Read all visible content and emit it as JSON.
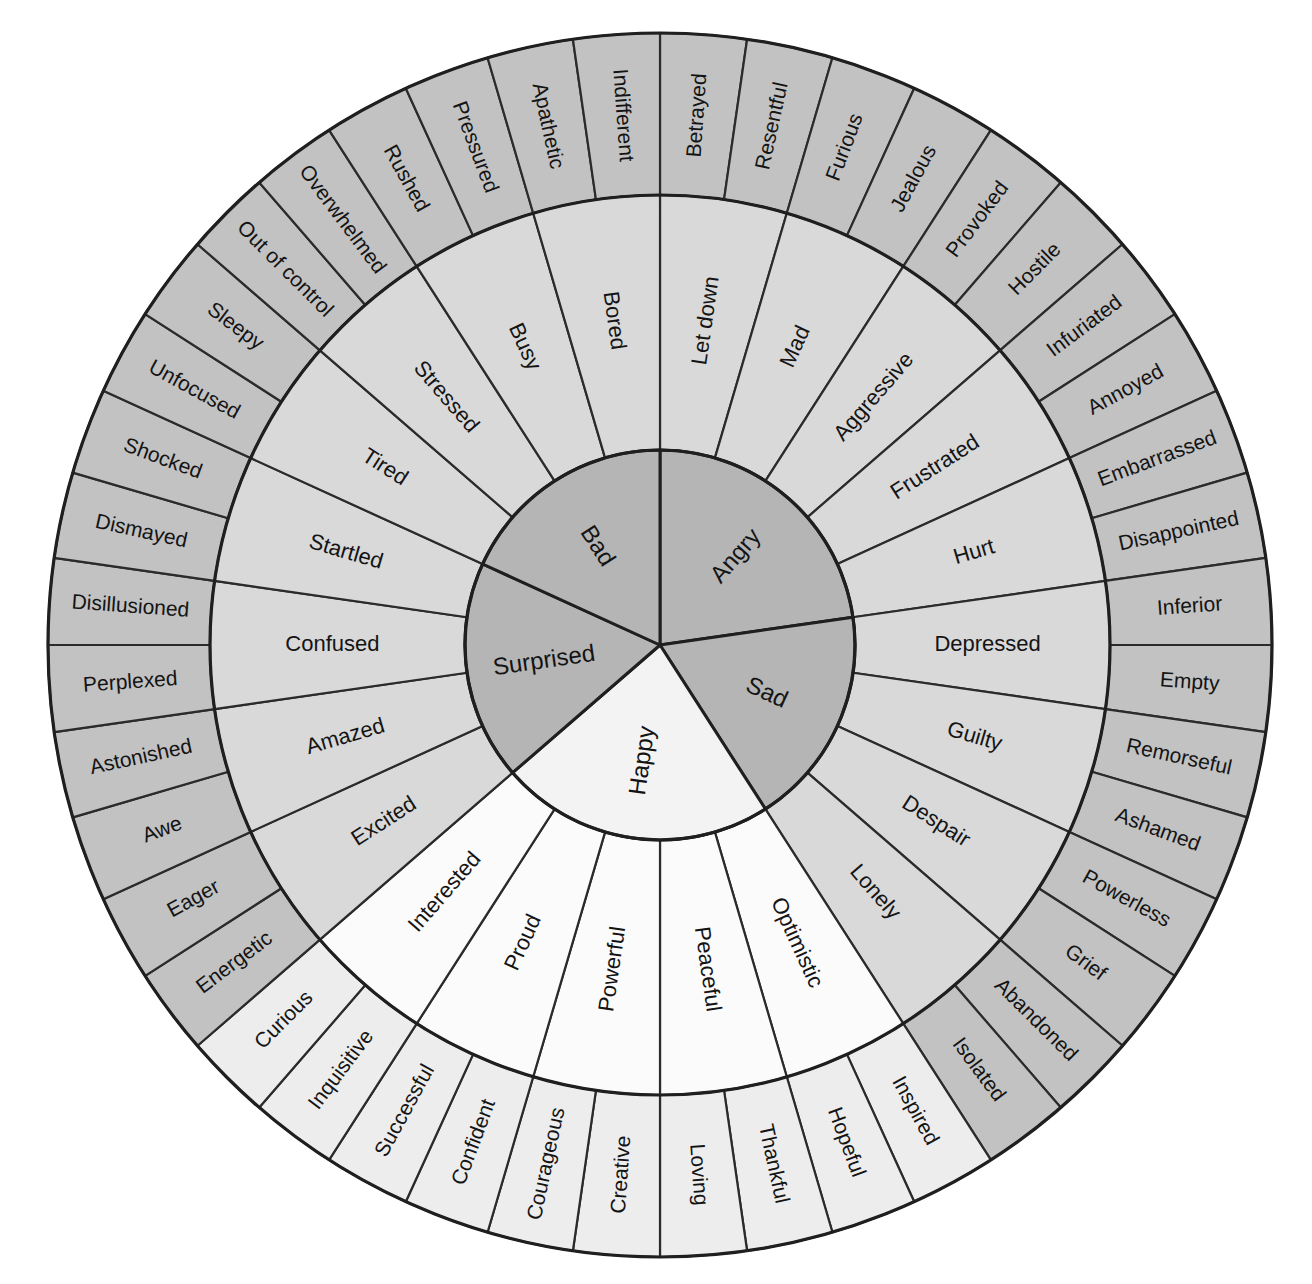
{
  "diagram": {
    "type": "sunburst-wheel",
    "rings": 3,
    "colors": {
      "core_dark": "#b5b5b5",
      "core_light": "#f3f3f3",
      "mid_dark": "#d9d9d9",
      "mid_light": "#fbfbfb",
      "outer_dark": "#c2c2c2",
      "outer_light": "#ededed",
      "stroke": "#2b2b2b",
      "background": "#ffffff"
    },
    "geometry": {
      "center_x": 660,
      "center_y": 645,
      "r_inner": 195,
      "r_mid": 450,
      "r_outer": 612,
      "start_angle_deg": 0
    }
  },
  "sectors": [
    {
      "core": "Angry",
      "tone": "dark",
      "middle": [
        {
          "label": "Let down",
          "outer": [
            "Betrayed",
            "Resentful"
          ]
        },
        {
          "label": "Mad",
          "outer": [
            "Furious",
            "Jealous"
          ]
        },
        {
          "label": "Aggressive",
          "outer": [
            "Provoked",
            "Hostile"
          ]
        },
        {
          "label": "Frustrated",
          "outer": [
            "Infuriated",
            "Annoyed"
          ]
        },
        {
          "label": "Hurt",
          "outer": [
            "Embarrassed",
            "Disappointed"
          ]
        }
      ]
    },
    {
      "core": "Sad",
      "tone": "dark",
      "middle": [
        {
          "label": "Depressed",
          "outer": [
            "Inferior",
            "Empty"
          ]
        },
        {
          "label": "Guilty",
          "outer": [
            "Remorseful",
            "Ashamed"
          ]
        },
        {
          "label": "Despair",
          "outer": [
            "Powerless",
            "Grief"
          ]
        },
        {
          "label": "Lonely",
          "outer": [
            "Abandoned",
            "Isolated"
          ]
        }
      ]
    },
    {
      "core": "Happy",
      "tone": "light",
      "middle": [
        {
          "label": "Optimistic",
          "outer": [
            "Inspired",
            "Hopeful"
          ]
        },
        {
          "label": "Peaceful",
          "outer": [
            "Thankful",
            "Loving"
          ]
        },
        {
          "label": "Powerful",
          "outer": [
            "Creative",
            "Courageous"
          ]
        },
        {
          "label": "Proud",
          "outer": [
            "Confident",
            "Successful"
          ]
        },
        {
          "label": "Interested",
          "outer": [
            "Inquisitive",
            "Curious"
          ]
        }
      ]
    },
    {
      "core": "Surprised",
      "tone": "dark",
      "middle": [
        {
          "label": "Excited",
          "outer": [
            "Energetic",
            "Eager"
          ]
        },
        {
          "label": "Amazed",
          "outer": [
            "Awe",
            "Astonished"
          ]
        },
        {
          "label": "Confused",
          "outer": [
            "Perplexed",
            "Disillusioned"
          ]
        },
        {
          "label": "Startled",
          "outer": [
            "Dismayed",
            "Shocked"
          ]
        }
      ]
    },
    {
      "core": "Bad",
      "tone": "dark",
      "middle": [
        {
          "label": "Tired",
          "outer": [
            "Unfocused",
            "Sleepy"
          ]
        },
        {
          "label": "Stressed",
          "outer": [
            "Out of control",
            "Overwhelmed"
          ]
        },
        {
          "label": "Busy",
          "outer": [
            "Rushed",
            "Pressured"
          ]
        },
        {
          "label": "Bored",
          "outer": [
            "Apathetic",
            "Indifferent"
          ]
        }
      ]
    }
  ]
}
